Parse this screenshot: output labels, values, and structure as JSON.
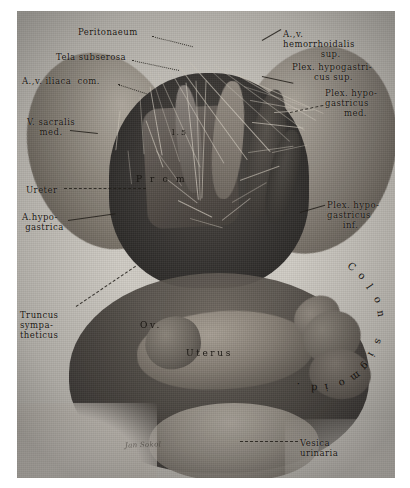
{
  "plate": {
    "title": "Pelvic autonomic nerve plexus dissection (female pelvis, anterior view)",
    "background_color": "#cfcbc4",
    "ink_color": "#17140f",
    "signature": "Jan Sokol"
  },
  "labels_left": [
    {
      "id": "peritonaeum",
      "text": "Peritonaeum",
      "x": 78,
      "y": 27
    },
    {
      "id": "tela-subserosa",
      "text": "Tela subserosa",
      "x": 56,
      "y": 52
    },
    {
      "id": "av-iliaca-com",
      "text": "A.,v. iliaca  com.",
      "x": 22,
      "y": 76
    },
    {
      "id": "v-sacralis-med",
      "text": "V. sacralis\n    med.",
      "x": 27,
      "y": 117
    },
    {
      "id": "ureter",
      "text": "Ureter",
      "x": 26,
      "y": 185
    },
    {
      "id": "a-hypogastrica",
      "text": "A.hypo-\n gastrica",
      "x": 22,
      "y": 212
    },
    {
      "id": "truncus-sympatheticus",
      "text": "Truncus\nsympa-\ntheticus",
      "x": 20,
      "y": 310
    }
  ],
  "labels_right": [
    {
      "id": "av-hemorrhoidalis-sup",
      "text": "A.,v.\nhemorrhoidalis\n            sup.",
      "x": 283,
      "y": 29
    },
    {
      "id": "plex-hypogastricus-sup",
      "text": "Plex. hypogastri-\n       cus sup.",
      "x": 292,
      "y": 62
    },
    {
      "id": "plex-hypogastricus-med",
      "text": "Plex. hypo-\ngastricus\n      med.",
      "x": 325,
      "y": 88
    },
    {
      "id": "plex-hypogastricus-inf",
      "text": "Plex. hypo-\ngastricus\n     inf.",
      "x": 327,
      "y": 200
    },
    {
      "id": "vesica-urinaria",
      "text": "Vesica\nurinaria",
      "x": 300,
      "y": 438
    }
  ],
  "labels_in_figure": [
    {
      "id": "vertebra-l5",
      "text": "l.5",
      "x": 172,
      "y": 128
    },
    {
      "id": "promontorium",
      "text": "P r o m",
      "x": 136,
      "y": 174
    },
    {
      "id": "ovarium",
      "text": "Ov.",
      "x": 140,
      "y": 320
    },
    {
      "id": "uterus",
      "text": "Uterus",
      "x": 186,
      "y": 348
    }
  ],
  "label_colon_sigmoid": {
    "id": "colon-sigmoideum",
    "chars": [
      "C",
      "o",
      "l",
      "o",
      "n",
      " ",
      "s",
      "i",
      "g",
      "m",
      "o",
      "i",
      "d",
      "."
    ],
    "text": "Colon sigmoid."
  },
  "leaders": [
    {
      "id": "leader-peritonaeum",
      "x": 152,
      "y": 36,
      "len": 42,
      "rot": 14,
      "style": "dot"
    },
    {
      "id": "leader-tela-subserosa",
      "x": 132,
      "y": 60,
      "len": 48,
      "rot": 12,
      "style": "dot"
    },
    {
      "id": "leader-iliaca",
      "x": 118,
      "y": 84,
      "len": 30,
      "rot": 18,
      "style": "dot"
    },
    {
      "id": "leader-sacralis",
      "x": 70,
      "y": 130,
      "len": 28,
      "rot": 6,
      "style": "solid"
    },
    {
      "id": "leader-ureter",
      "x": 64,
      "y": 188,
      "len": 82,
      "rot": 0,
      "style": "dash"
    },
    {
      "id": "leader-hypogastrica",
      "x": 68,
      "y": 220,
      "len": 48,
      "rot": -8,
      "style": "solid"
    },
    {
      "id": "leader-truncus",
      "x": 76,
      "y": 306,
      "len": 72,
      "rot": -34,
      "style": "dash"
    },
    {
      "id": "leader-hemorrhoidalis",
      "x": 262,
      "y": 40,
      "len": 22,
      "rot": -30,
      "style": "solid"
    },
    {
      "id": "leader-plex-sup",
      "x": 262,
      "y": 76,
      "len": 32,
      "rot": 12,
      "style": "solid"
    },
    {
      "id": "leader-plex-med",
      "x": 290,
      "y": 112,
      "len": 34,
      "rot": -12,
      "style": "dash"
    },
    {
      "id": "leader-plex-inf",
      "x": 300,
      "y": 212,
      "len": 26,
      "rot": -16,
      "style": "solid"
    },
    {
      "id": "leader-vesica",
      "x": 240,
      "y": 441,
      "len": 58,
      "rot": 0,
      "style": "dash"
    }
  ]
}
